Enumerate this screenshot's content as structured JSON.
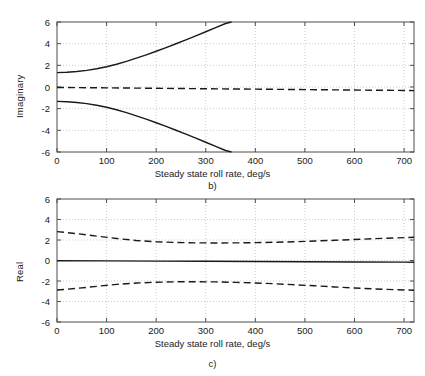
{
  "figure": {
    "background": "#ffffff",
    "axis_color": "#4d4d4d",
    "grid_color": "#bfbfbf",
    "curve_color": "#1a1a1a"
  },
  "chart_data": [
    {
      "type": "line",
      "panel_label": "b)",
      "title": "",
      "xlabel": "Steady state roll rate, deg/s",
      "ylabel": "Imaginary",
      "xlim": [
        0,
        720
      ],
      "ylim": [
        -6,
        6
      ],
      "xticks": [
        0,
        100,
        200,
        300,
        400,
        500,
        600,
        700
      ],
      "xticklabels": [
        "0",
        "100",
        "200",
        "300",
        "400",
        "500",
        "600",
        "700"
      ],
      "yticks": [
        -6,
        -4,
        -2,
        0,
        2,
        4,
        6
      ],
      "yticklabels": [
        "-6",
        "-4",
        "-2",
        "0",
        "2",
        "4",
        "6"
      ],
      "grid": true,
      "grid_style": "dotted",
      "legend": "none",
      "series": [
        {
          "name": "upper-branch",
          "style": "solid",
          "x": [
            0,
            20,
            40,
            60,
            80,
            100,
            120,
            140,
            160,
            180,
            200,
            220,
            240,
            260,
            280,
            300,
            320,
            340,
            352
          ],
          "y": [
            1.33,
            1.36,
            1.43,
            1.53,
            1.68,
            1.87,
            2.1,
            2.37,
            2.66,
            2.97,
            3.3,
            3.64,
            3.99,
            4.35,
            4.72,
            5.1,
            5.48,
            5.86,
            6.0
          ]
        },
        {
          "name": "lower-branch",
          "style": "solid",
          "x": [
            0,
            20,
            40,
            60,
            80,
            100,
            120,
            140,
            160,
            180,
            200,
            220,
            240,
            260,
            280,
            300,
            320,
            340,
            352
          ],
          "y": [
            -1.33,
            -1.36,
            -1.43,
            -1.53,
            -1.68,
            -1.87,
            -2.1,
            -2.37,
            -2.66,
            -2.97,
            -3.3,
            -3.64,
            -3.99,
            -4.35,
            -4.72,
            -5.1,
            -5.48,
            -5.86,
            -6.0
          ]
        },
        {
          "name": "real-root-branch",
          "style": "dashed",
          "x": [
            0,
            100,
            200,
            300,
            400,
            500,
            600,
            700,
            720
          ],
          "y": [
            -0.04,
            -0.08,
            -0.12,
            -0.16,
            -0.2,
            -0.24,
            -0.28,
            -0.32,
            -0.33
          ]
        }
      ]
    },
    {
      "type": "line",
      "panel_label": "c)",
      "title": "",
      "xlabel": "Steady state roll rate, deg/s",
      "ylabel": "Real",
      "xlim": [
        0,
        720
      ],
      "ylim": [
        -6,
        6
      ],
      "xticks": [
        0,
        100,
        200,
        300,
        400,
        500,
        600,
        700
      ],
      "xticklabels": [
        "0",
        "100",
        "200",
        "300",
        "400",
        "500",
        "600",
        "700"
      ],
      "yticks": [
        -6,
        -4,
        -2,
        0,
        2,
        4,
        6
      ],
      "yticklabels": [
        "-6",
        "-4",
        "-2",
        "0",
        "2",
        "4",
        "6"
      ],
      "grid": true,
      "grid_style": "dotted",
      "legend": "none",
      "series": [
        {
          "name": "upper-dashed-branch",
          "style": "dashed",
          "x": [
            0,
            40,
            80,
            120,
            160,
            200,
            240,
            280,
            320,
            360,
            400,
            440,
            480,
            520,
            560,
            600,
            640,
            680,
            720
          ],
          "y": [
            2.82,
            2.62,
            2.38,
            2.15,
            1.95,
            1.83,
            1.76,
            1.72,
            1.71,
            1.72,
            1.74,
            1.78,
            1.83,
            1.9,
            1.97,
            2.05,
            2.13,
            2.2,
            2.27
          ]
        },
        {
          "name": "zero-solid-branch",
          "style": "solid",
          "x": [
            0,
            100,
            200,
            300,
            400,
            500,
            600,
            700,
            720
          ],
          "y": [
            -0.02,
            -0.04,
            -0.06,
            -0.08,
            -0.1,
            -0.12,
            -0.14,
            -0.16,
            -0.17
          ]
        },
        {
          "name": "lower-dashed-branch",
          "style": "dashed",
          "x": [
            0,
            40,
            80,
            120,
            160,
            200,
            240,
            280,
            320,
            360,
            400,
            440,
            480,
            520,
            560,
            600,
            640,
            680,
            720
          ],
          "y": [
            -2.88,
            -2.72,
            -2.52,
            -2.33,
            -2.2,
            -2.12,
            -2.08,
            -2.07,
            -2.09,
            -2.13,
            -2.19,
            -2.27,
            -2.37,
            -2.47,
            -2.58,
            -2.68,
            -2.77,
            -2.84,
            -2.9
          ]
        }
      ]
    }
  ]
}
